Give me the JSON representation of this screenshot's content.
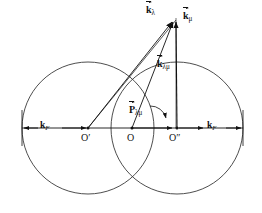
{
  "figure": {
    "type": "vector-diagram",
    "background_color": "#ffffff",
    "stroke_color": "#111111"
  },
  "labels": {
    "k_lambda": {
      "base": "k",
      "sub": "λ",
      "x": 148,
      "y": 8
    },
    "k_mu": {
      "base": "k",
      "sub": "μ",
      "x": 182,
      "y": 14
    },
    "k_lambda_mu": {
      "base": "k",
      "sub": "λμ",
      "x": 158,
      "y": 62
    },
    "P_lambda_mu": {
      "base": "P",
      "sub": "λμ",
      "x": 129,
      "y": 108
    },
    "kF_left": {
      "base": "k",
      "sub": "F",
      "x": 40,
      "y": 120
    },
    "kF_right": {
      "base": "k",
      "sub": "F",
      "x": 208,
      "y": 120
    },
    "origin_left": {
      "text": "O′",
      "x": 82,
      "y": 134
    },
    "origin_center": {
      "text": "O",
      "x": 128,
      "y": 134
    },
    "origin_right": {
      "text": "O″",
      "x": 170,
      "y": 134
    }
  },
  "geometry": {
    "circle_left": {
      "cx": 88,
      "cy": 128,
      "r": 66
    },
    "circle_right": {
      "cx": 177,
      "cy": 128,
      "r": 66
    },
    "baseline": {
      "x1": 22,
      "y1": 128,
      "x2": 243,
      "y2": 128
    },
    "apex": {
      "x": 174,
      "y": 18
    },
    "point_O_prime": {
      "x": 88,
      "y": 128
    },
    "point_O": {
      "x": 132,
      "y": 128
    },
    "point_O_dprime": {
      "x": 177,
      "y": 128
    }
  }
}
